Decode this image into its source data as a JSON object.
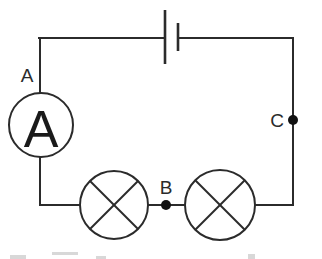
{
  "diagram": {
    "background_color": "#ffffff",
    "line_color": "#2b2b2b",
    "node_color": "#111111",
    "components": {
      "ammeter": {
        "symbol_name": "ammeter-circle",
        "glyph": "A",
        "label": "A",
        "center_x": 41,
        "center_y": 125,
        "radius": 32
      },
      "battery": {
        "symbol_name": "battery-cell",
        "long_plate_x": 165,
        "long_plate_y1": 10,
        "long_plate_y2": 64,
        "short_plate_x": 178,
        "short_plate_y1": 23,
        "short_plate_y2": 51
      },
      "lamp_left": {
        "symbol_name": "lamp-cross-circle",
        "center_x": 114,
        "center_y": 205,
        "radius": 34
      },
      "lamp_right": {
        "symbol_name": "lamp-cross-circle",
        "center_x": 220,
        "center_y": 205,
        "radius": 35
      }
    },
    "nodes": [
      {
        "id": "A",
        "label": "A",
        "kind": "label-only",
        "label_x": 27,
        "label_y": 82
      },
      {
        "id": "B",
        "label": "B",
        "kind": "junction-dot",
        "dot_x": 166,
        "dot_y": 205,
        "dot_r": 5,
        "label_x": 166,
        "label_y": 194
      },
      {
        "id": "C",
        "label": "C",
        "kind": "junction-dot",
        "dot_x": 293,
        "dot_y": 120,
        "dot_r": 5,
        "label_x": 277,
        "label_y": 127
      }
    ],
    "wires": {
      "top_left_corner_x": 39,
      "top_right_corner_x": 293,
      "top_y": 38,
      "bottom_y": 205,
      "left_x": 41,
      "right_x": 293
    }
  }
}
